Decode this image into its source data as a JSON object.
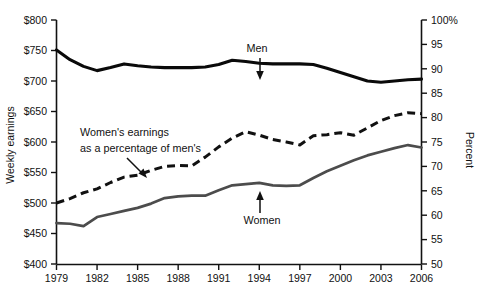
{
  "chart_data": {
    "type": "line",
    "title": "",
    "xlabel": "",
    "ylabel": "Weekly earnings",
    "y2label": "Percent",
    "xlim": [
      1979,
      2006
    ],
    "ylim": [
      400,
      800
    ],
    "y2lim": [
      50,
      100
    ],
    "grid": false,
    "legend": "annotations-inline",
    "x": [
      1979,
      1980,
      1981,
      1982,
      1983,
      1984,
      1985,
      1986,
      1987,
      1988,
      1989,
      1990,
      1991,
      1992,
      1993,
      1994,
      1995,
      1996,
      1997,
      1998,
      1999,
      2000,
      2001,
      2002,
      2003,
      2004,
      2005,
      2006
    ],
    "left_axis_ticks": [
      "$400",
      "$450",
      "$500",
      "$550",
      "$600",
      "$650",
      "$700",
      "$750",
      "$800"
    ],
    "left_axis_values": [
      400,
      450,
      500,
      550,
      600,
      650,
      700,
      750,
      800
    ],
    "right_axis_ticks": [
      "50",
      "55",
      "60",
      "65",
      "70",
      "75",
      "80",
      "85",
      "90",
      "95",
      "100%"
    ],
    "right_axis_values": [
      50,
      55,
      60,
      65,
      70,
      75,
      80,
      85,
      90,
      95,
      100
    ],
    "x_axis_ticks": [
      "1979",
      "1982",
      "1985",
      "1988",
      "1991",
      "1994",
      "1997",
      "2000",
      "2003",
      "2006"
    ],
    "x_axis_tick_values": [
      1979,
      1982,
      1985,
      1988,
      1991,
      1994,
      1997,
      2000,
      2003,
      2006
    ],
    "series": [
      {
        "name": "Men",
        "axis": "left",
        "style": "solid-black",
        "color": "#0a0a0a",
        "values": [
          751,
          735,
          724,
          717,
          722,
          728,
          725,
          723,
          722,
          722,
          722,
          723,
          727,
          734,
          732,
          729,
          728,
          728,
          728,
          727,
          721,
          714,
          707,
          700,
          698,
          700,
          702,
          703
        ]
      },
      {
        "name": "Women",
        "axis": "left",
        "style": "solid-gray",
        "color": "#4c4c4c",
        "values": [
          467,
          466,
          462,
          477,
          482,
          487,
          492,
          499,
          508,
          511,
          512,
          512,
          521,
          529,
          531,
          533,
          529,
          528,
          529,
          541,
          552,
          561,
          570,
          578,
          584,
          590,
          595,
          591
        ]
      },
      {
        "name": "Women's earnings as a percentage of men's",
        "axis": "right",
        "style": "dashed-black",
        "color": "#111111",
        "values": [
          62.5,
          63.4,
          64.6,
          65.4,
          66.7,
          67.8,
          68.2,
          69.2,
          70.0,
          70.2,
          70.1,
          71.9,
          74.0,
          75.8,
          77.1,
          76.4,
          75.5,
          75.0,
          74.4,
          76.3,
          76.5,
          76.9,
          76.4,
          77.9,
          79.4,
          80.4,
          81.0,
          80.8
        ]
      }
    ],
    "annotations": [
      {
        "id": "men-label",
        "text": "Men",
        "x_px": 257,
        "y_px": 50,
        "arrow": "down"
      },
      {
        "id": "women-label",
        "text": "Women",
        "x_px": 257,
        "y_px": 220,
        "arrow": "up"
      },
      {
        "id": "ratio-label-line1",
        "text": "Women's earnings",
        "x_px": 80,
        "y_px": 132,
        "arrow": "diagonal"
      },
      {
        "id": "ratio-label-line2",
        "text": "as a percentage of men's",
        "x_px": 80,
        "y_px": 148,
        "arrow": "none"
      }
    ]
  }
}
